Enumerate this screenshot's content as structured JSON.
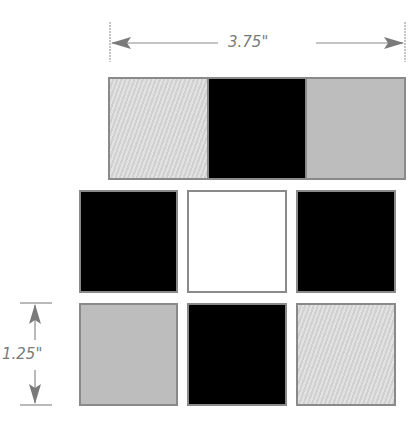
{
  "dimensions": {
    "width_label": "3.75\"",
    "height_label": "1.25\""
  },
  "rows": [
    {
      "name": "top-strip",
      "squares": [
        "hatch",
        "black",
        "gray"
      ]
    },
    {
      "name": "middle-row",
      "squares": [
        "black",
        "white",
        "black"
      ]
    },
    {
      "name": "bottom-row",
      "squares": [
        "gray",
        "black",
        "hatch"
      ]
    }
  ],
  "colors": {
    "black": "#000000",
    "white": "#ffffff",
    "gray": "#bdbdbd",
    "hatch": "#dadada",
    "border": "#8a8a8a",
    "dimension_line": "#7a7a7a"
  }
}
